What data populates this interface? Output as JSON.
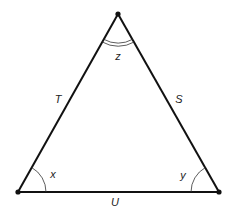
{
  "figure": {
    "type": "triangle",
    "stroke_color": "#111111",
    "vertices": {
      "top": [
        118,
        14
      ],
      "bottom_left": [
        18,
        192
      ],
      "bottom_right": [
        219,
        192
      ]
    },
    "sides": {
      "left": "T",
      "right": "S",
      "bottom": "U"
    },
    "angles": {
      "bottom_left": "x",
      "bottom_right": "y",
      "top": "z"
    }
  }
}
